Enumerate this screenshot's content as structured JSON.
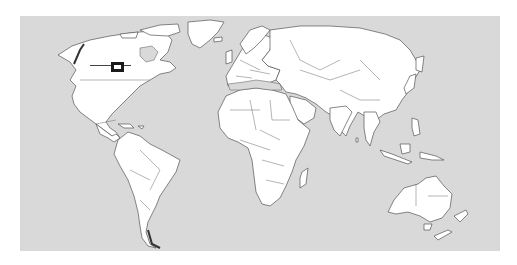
{
  "map": {
    "projection": "world-equirectangular",
    "ocean_color": "#d9d9d9",
    "land_color": "#ffffff",
    "border_color": "#555555",
    "marker": {
      "type": "rectangle",
      "region": "Great Lakes, North America",
      "color": "#1a1a1a",
      "leader_line": true
    }
  }
}
